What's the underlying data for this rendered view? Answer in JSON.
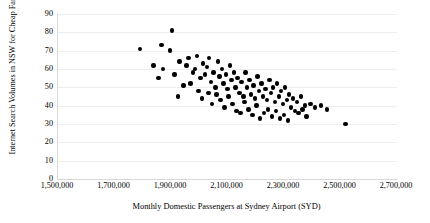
{
  "chart_data": {
    "type": "scatter",
    "title": "",
    "xlabel": "Monthly Domestic Passengers at Sydney Airport (SYD)",
    "ylabel": "Internet Search Volumes in NSW for Cheap Fares",
    "xlim": [
      1500000,
      2700000
    ],
    "ylim": [
      0,
      90
    ],
    "xticks": [
      "1,500,000",
      "1,700,000",
      "1,900,000",
      "2,100,000",
      "2,300,000",
      "2,500,000",
      "2,700,000"
    ],
    "xtick_values": [
      1500000,
      1700000,
      1900000,
      2100000,
      2300000,
      2500000,
      2700000
    ],
    "yticks": [
      "0",
      "10",
      "20",
      "30",
      "40",
      "50",
      "60",
      "70",
      "80",
      "90"
    ],
    "ytick_values": [
      0,
      10,
      20,
      30,
      40,
      50,
      60,
      70,
      80,
      90
    ],
    "grid": "horizontal",
    "legend": null,
    "marker": {
      "shape": "circle",
      "color": "#000000",
      "size": 4.4
    },
    "series": [
      {
        "name": "Monthly observations",
        "points": [
          [
            1790000,
            71
          ],
          [
            1866000,
            73
          ],
          [
            1838000,
            62
          ],
          [
            1872000,
            60
          ],
          [
            1856000,
            55
          ],
          [
            1903000,
            81
          ],
          [
            1896000,
            70
          ],
          [
            1930000,
            64
          ],
          [
            1913000,
            57
          ],
          [
            1944000,
            51
          ],
          [
            1924000,
            45
          ],
          [
            1962000,
            66
          ],
          [
            1955000,
            62
          ],
          [
            1978000,
            58
          ],
          [
            1969000,
            52
          ],
          [
            1992000,
            67
          ],
          [
            1986000,
            60
          ],
          [
            2004000,
            55
          ],
          [
            1998000,
            48
          ],
          [
            2014000,
            63
          ],
          [
            2021000,
            57
          ],
          [
            2010000,
            44
          ],
          [
            2035000,
            66
          ],
          [
            2028000,
            61
          ],
          [
            2042000,
            53
          ],
          [
            2033000,
            47
          ],
          [
            2050000,
            58
          ],
          [
            2057000,
            50
          ],
          [
            2046000,
            41
          ],
          [
            2066000,
            64
          ],
          [
            2072000,
            56
          ],
          [
            2061000,
            46
          ],
          [
            2080000,
            60
          ],
          [
            2086000,
            52
          ],
          [
            2075000,
            43
          ],
          [
            2094000,
            57
          ],
          [
            2100000,
            49
          ],
          [
            2090000,
            39
          ],
          [
            2108000,
            62
          ],
          [
            2114000,
            54
          ],
          [
            2104000,
            45
          ],
          [
            2122000,
            58
          ],
          [
            2128000,
            50
          ],
          [
            2118000,
            41
          ],
          [
            2136000,
            55
          ],
          [
            2142000,
            47
          ],
          [
            2132000,
            37
          ],
          [
            2150000,
            53
          ],
          [
            2156000,
            45
          ],
          [
            2146000,
            36
          ],
          [
            2164000,
            58
          ],
          [
            2170000,
            50
          ],
          [
            2160000,
            42
          ],
          [
            2178000,
            54
          ],
          [
            2184000,
            46
          ],
          [
            2174000,
            38
          ],
          [
            2192000,
            51
          ],
          [
            2198000,
            44
          ],
          [
            2188000,
            35
          ],
          [
            2206000,
            56
          ],
          [
            2212000,
            48
          ],
          [
            2202000,
            40
          ],
          [
            2220000,
            52
          ],
          [
            2226000,
            45
          ],
          [
            2216000,
            33
          ],
          [
            2234000,
            49
          ],
          [
            2240000,
            43
          ],
          [
            2230000,
            36
          ],
          [
            2248000,
            54
          ],
          [
            2254000,
            47
          ],
          [
            2244000,
            38
          ],
          [
            2262000,
            50
          ],
          [
            2268000,
            42
          ],
          [
            2258000,
            34
          ],
          [
            2276000,
            52
          ],
          [
            2282000,
            45
          ],
          [
            2272000,
            37
          ],
          [
            2290000,
            48
          ],
          [
            2296000,
            41
          ],
          [
            2286000,
            33
          ],
          [
            2304000,
            50
          ],
          [
            2310000,
            43
          ],
          [
            2300000,
            35
          ],
          [
            2318000,
            46
          ],
          [
            2324000,
            39
          ],
          [
            2314000,
            32
          ],
          [
            2332000,
            44
          ],
          [
            2338000,
            37
          ],
          [
            2346000,
            42
          ],
          [
            2352000,
            36
          ],
          [
            2360000,
            45
          ],
          [
            2366000,
            38
          ],
          [
            2374000,
            40
          ],
          [
            2380000,
            34
          ],
          [
            2394000,
            41
          ],
          [
            2410000,
            39
          ],
          [
            2432000,
            40
          ],
          [
            2452000,
            38
          ],
          [
            2518000,
            30
          ]
        ]
      }
    ]
  }
}
